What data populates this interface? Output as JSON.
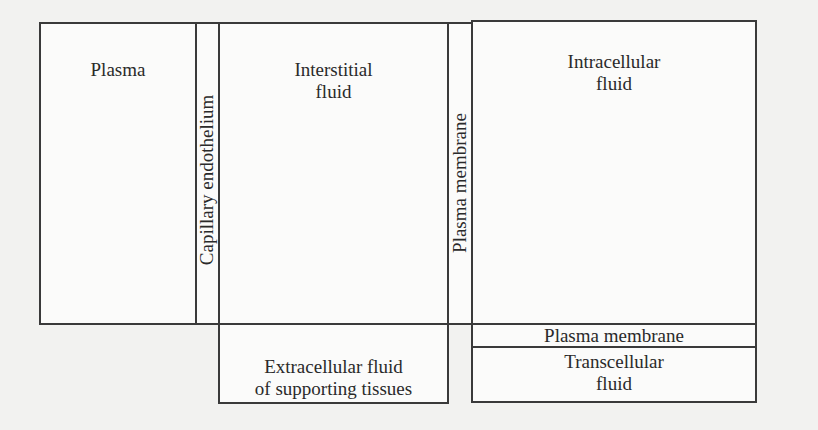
{
  "diagram": {
    "type": "fluid-compartments",
    "compartments": {
      "plasma": {
        "label": "Plasma"
      },
      "capillary_endothelium": {
        "label": "Capillary endothelium"
      },
      "interstitial_fluid": {
        "label": "Interstitial\nfluid"
      },
      "plasma_membrane_vertical": {
        "label": "Plasma membrane"
      },
      "intracellular_fluid": {
        "label": "Intracellular\nfluid"
      },
      "extracellular_supporting": {
        "label": "Extracellular fluid\nof supporting tissues"
      },
      "plasma_membrane_horizontal": {
        "label": "Plasma membrane"
      },
      "transcellular_fluid": {
        "label": "Transcellular\nfluid"
      }
    },
    "colors": {
      "line": "#3a3a3a",
      "background": "#f2f2f0",
      "text": "#2a2a2a"
    }
  }
}
